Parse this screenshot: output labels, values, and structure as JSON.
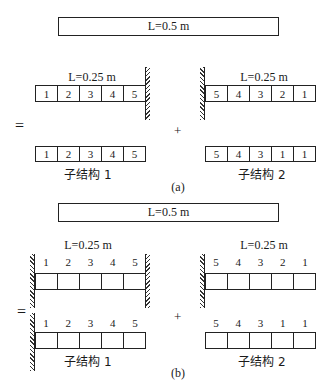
{
  "part_a": {
    "full_beam_label": "L=0.5 m",
    "left": {
      "length_label": "L=0.25 m",
      "support": "right-wall",
      "cells": [
        "1",
        "2",
        "3",
        "4",
        "5"
      ]
    },
    "right": {
      "length_label": "L=0.25 m",
      "support": "left-wall",
      "cells": [
        "5",
        "4",
        "3",
        "2",
        "1"
      ]
    },
    "equals": "=",
    "plus": "+",
    "sub1": {
      "cells": [
        "1",
        "2",
        "3",
        "4",
        "5"
      ],
      "caption": "子结构 1"
    },
    "sub2": {
      "cells": [
        "5",
        "4",
        "3",
        "1",
        "1"
      ],
      "caption": "子结构 2"
    },
    "label": "(a)"
  },
  "part_b": {
    "full_beam_label": "L=0.5 m",
    "left": {
      "length_label": "L=0.25 m",
      "support": "both-walls",
      "nodes": [
        "1",
        "2",
        "3",
        "4",
        "5"
      ]
    },
    "right": {
      "length_label": "L=0.25 m",
      "support": "left-wall",
      "nodes": [
        "5",
        "4",
        "3",
        "2",
        "1"
      ]
    },
    "equals": "=",
    "plus": "+",
    "sub1": {
      "nodes": [
        "1",
        "2",
        "3",
        "4",
        "5"
      ],
      "support": "left-wall",
      "caption": "子结构 1"
    },
    "sub2": {
      "nodes": [
        "5",
        "4",
        "3",
        "1",
        "1"
      ],
      "support": "none",
      "caption": "子结构 2"
    },
    "label": "(b)"
  }
}
